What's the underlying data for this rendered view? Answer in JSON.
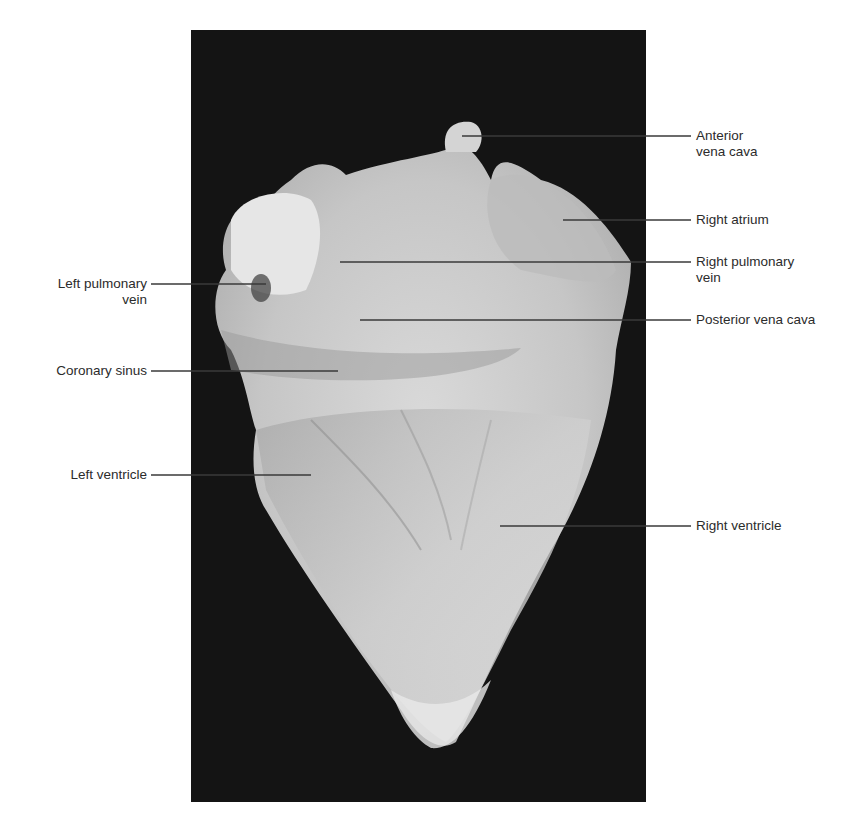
{
  "figure": {
    "background_color": "#ffffff",
    "photo_background_color": "#141414",
    "leader_line_color": "#3a3a3a"
  },
  "labels": {
    "left": [
      {
        "id": "left-pulmonary-vein",
        "line1": "Left pulmonary",
        "line2": "vein"
      },
      {
        "id": "coronary-sinus",
        "line1": "Coronary sinus",
        "line2": ""
      },
      {
        "id": "left-ventricle",
        "line1": "Left ventricle",
        "line2": ""
      }
    ],
    "right": [
      {
        "id": "anterior-vena-cava",
        "line1": "Anterior",
        "line2": "vena cava"
      },
      {
        "id": "right-atrium",
        "line1": "Right atrium",
        "line2": ""
      },
      {
        "id": "right-pulmonary-vein",
        "line1": "Right pulmonary",
        "line2": "vein"
      },
      {
        "id": "posterior-vena-cava",
        "line1": "Posterior vena cava",
        "line2": ""
      },
      {
        "id": "right-ventricle",
        "line1": "Right ventricle",
        "line2": ""
      }
    ]
  }
}
